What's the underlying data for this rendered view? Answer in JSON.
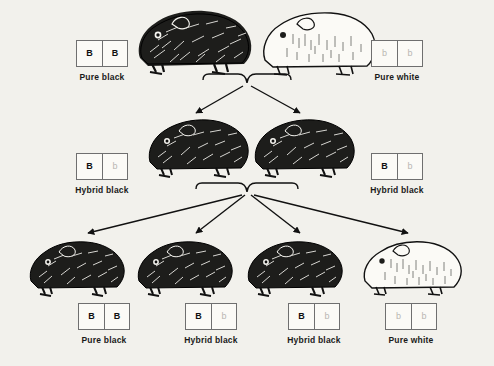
{
  "figure": {
    "background_color": "#f2f1ec",
    "ink_color": "#111111",
    "recessive_letter_color": "#b9b7b2"
  },
  "alleles": {
    "dominant": "B",
    "recessive": "b"
  },
  "generations": [
    {
      "name": "parent",
      "organisms": [
        {
          "id": "p1",
          "caption": "Pure black",
          "genotype": [
            "B",
            "B"
          ],
          "allele_types": [
            "dom",
            "dom"
          ],
          "coat": "black"
        },
        {
          "id": "p2",
          "caption": "Pure white",
          "genotype": [
            "b",
            "b"
          ],
          "allele_types": [
            "rec",
            "rec"
          ],
          "coat": "white"
        }
      ]
    },
    {
      "name": "f1",
      "organisms": [
        {
          "id": "f1a",
          "caption": "Hybrid black",
          "genotype": [
            "B",
            "b"
          ],
          "allele_types": [
            "dom",
            "rec"
          ],
          "coat": "black"
        },
        {
          "id": "f1b",
          "caption": "Hybrid black",
          "genotype": [
            "B",
            "b"
          ],
          "allele_types": [
            "dom",
            "rec"
          ],
          "coat": "black"
        }
      ]
    },
    {
      "name": "f2",
      "organisms": [
        {
          "id": "f2a",
          "caption": "Pure black",
          "genotype": [
            "B",
            "B"
          ],
          "allele_types": [
            "dom",
            "dom"
          ],
          "coat": "black"
        },
        {
          "id": "f2b",
          "caption": "Hybrid black",
          "genotype": [
            "B",
            "b"
          ],
          "allele_types": [
            "dom",
            "rec"
          ],
          "coat": "black"
        },
        {
          "id": "f2c",
          "caption": "Hybrid black",
          "genotype": [
            "B",
            "b"
          ],
          "allele_types": [
            "dom",
            "rec"
          ],
          "coat": "black"
        },
        {
          "id": "f2d",
          "caption": "Pure white",
          "genotype": [
            "b",
            "b"
          ],
          "allele_types": [
            "rec",
            "rec"
          ],
          "coat": "white"
        }
      ]
    }
  ]
}
